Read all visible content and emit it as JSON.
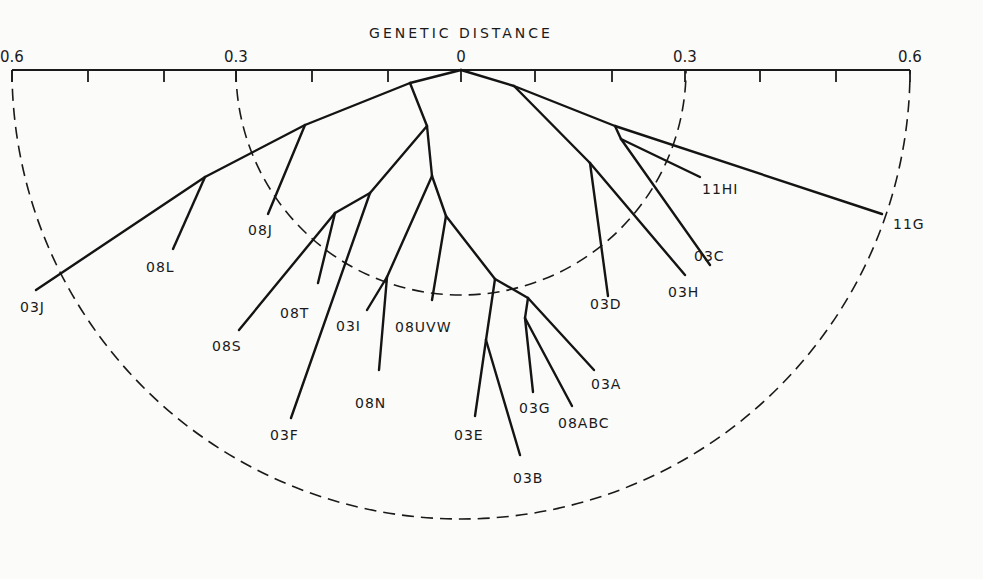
{
  "diagram": {
    "title": "GENETIC DISTANCE",
    "axis": {
      "ticks": [
        {
          "label": "0.6",
          "x": 12
        },
        {
          "label": "0.3",
          "x": 236
        },
        {
          "label": "0",
          "x": 461
        },
        {
          "label": "0.3",
          "x": 685
        },
        {
          "label": "0.6",
          "x": 910
        }
      ],
      "minor_ticks_x": [
        88,
        164,
        312,
        388,
        535,
        612,
        760,
        836
      ]
    },
    "rings": [
      {
        "distance": 0.3,
        "radius": 225
      },
      {
        "distance": 0.6,
        "radius": 449
      }
    ],
    "nodes": {
      "root": [
        461,
        70
      ],
      "a": [
        410,
        83
      ],
      "ldeep": [
        305,
        125
      ],
      "l2": [
        205,
        177
      ],
      "b": [
        427,
        126
      ],
      "c": [
        370,
        193
      ],
      "d": [
        335,
        213
      ],
      "e": [
        432,
        176
      ],
      "n03i": [
        387,
        277
      ],
      "f": [
        446,
        216
      ],
      "g": [
        495,
        279
      ],
      "h": [
        486,
        340
      ],
      "i": [
        528,
        298
      ],
      "j": [
        525,
        318
      ],
      "k": [
        514,
        86
      ],
      "l": [
        590,
        163
      ],
      "m": [
        615,
        126
      ],
      "n": [
        621,
        139
      ]
    },
    "edges": [
      [
        "root",
        "a"
      ],
      [
        "a",
        "ldeep"
      ],
      [
        "ldeep",
        "l2"
      ],
      [
        "a",
        "b"
      ],
      [
        "b",
        "c"
      ],
      [
        "c",
        "d"
      ],
      [
        "b",
        "e"
      ],
      [
        "e",
        "n03i"
      ],
      [
        "e",
        "f"
      ],
      [
        "f",
        "g"
      ],
      [
        "g",
        "h"
      ],
      [
        "g",
        "i"
      ],
      [
        "i",
        "j"
      ],
      [
        "root",
        "k"
      ],
      [
        "k",
        "l"
      ],
      [
        "k",
        "m"
      ],
      [
        "m",
        "n"
      ]
    ],
    "leaves": [
      {
        "label": "03J",
        "from": "l2",
        "tip": [
          36,
          290
        ],
        "text_at": [
          20,
          312
        ]
      },
      {
        "label": "08L",
        "from": "l2",
        "tip": [
          173,
          249
        ],
        "text_at": [
          146,
          272
        ]
      },
      {
        "label": "08J",
        "from": "ldeep",
        "tip": [
          268,
          214
        ],
        "text_at": [
          248,
          235
        ]
      },
      {
        "label": "08S",
        "from": "d",
        "tip": [
          239,
          330
        ],
        "text_at": [
          212,
          351
        ]
      },
      {
        "label": "08T",
        "from": "d",
        "tip": [
          318,
          283
        ],
        "text_at": [
          280,
          318
        ]
      },
      {
        "label": "03F",
        "from": "c",
        "tip": [
          291,
          418
        ],
        "text_at": [
          270,
          440
        ]
      },
      {
        "label": "03I",
        "from": "n03i",
        "tip": [
          367,
          310
        ],
        "text_at": [
          336,
          331
        ]
      },
      {
        "label": "08N",
        "from": "n03i",
        "tip": [
          379,
          370
        ],
        "text_at": [
          355,
          408
        ]
      },
      {
        "label": "08UVW",
        "from": "f",
        "tip": [
          432,
          300
        ],
        "text_at": [
          395,
          332
        ]
      },
      {
        "label": "03E",
        "from": "h",
        "tip": [
          475,
          416
        ],
        "text_at": [
          454,
          440
        ]
      },
      {
        "label": "03B",
        "from": "h",
        "tip": [
          520,
          455
        ],
        "text_at": [
          513,
          483
        ]
      },
      {
        "label": "03G",
        "from": "j",
        "tip": [
          533,
          392
        ],
        "text_at": [
          519,
          413
        ]
      },
      {
        "label": "08ABC",
        "from": "j",
        "tip": [
          572,
          406
        ],
        "text_at": [
          558,
          428
        ]
      },
      {
        "label": "03A",
        "from": "i",
        "tip": [
          594,
          370
        ],
        "text_at": [
          591,
          389
        ]
      },
      {
        "label": "03D",
        "from": "l",
        "tip": [
          608,
          296
        ],
        "text_at": [
          590,
          309
        ]
      },
      {
        "label": "03H",
        "from": "l",
        "tip": [
          685,
          275
        ],
        "text_at": [
          668,
          297
        ]
      },
      {
        "label": "03C",
        "from": "n",
        "tip": [
          710,
          265
        ],
        "text_at": [
          694,
          261
        ]
      },
      {
        "label": "11HI",
        "from": "n",
        "tip": [
          700,
          177
        ],
        "text_at": [
          702,
          194
        ]
      },
      {
        "label": "11G",
        "from": "m",
        "tip": [
          882,
          214
        ],
        "text_at": [
          893,
          229
        ]
      }
    ]
  }
}
